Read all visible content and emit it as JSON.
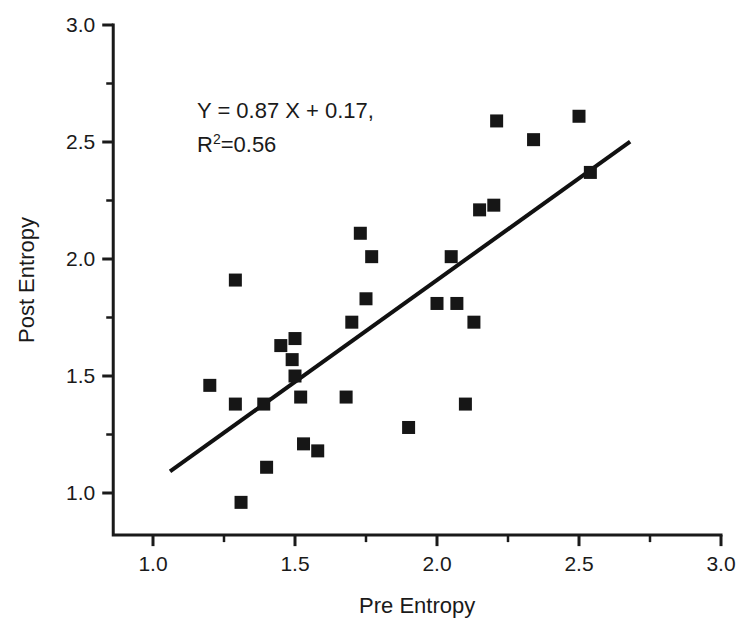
{
  "figure": {
    "background": "#ffffff",
    "foreground": "#1a1a1a",
    "marker_color": "#161616",
    "line_color": "#111111"
  },
  "annotation": {
    "equation": "Y = 0.87 X + 0.17,",
    "r_symbol": "R",
    "r_exponent": "2",
    "r_value": "=0.56"
  },
  "chart_data": {
    "type": "scatter",
    "title": "",
    "xlabel": "Pre Entropy",
    "ylabel": "Post Entropy",
    "xlim": [
      0.86,
      3.0
    ],
    "ylim": [
      0.82,
      3.0
    ],
    "xticks": [
      1.0,
      1.5,
      2.0,
      2.5,
      3.0
    ],
    "xtick_labels": [
      "1.0",
      "1.5",
      "2.0",
      "2.5",
      "3.0"
    ],
    "xminor_ticks": [
      1.25,
      1.75,
      2.25,
      2.75
    ],
    "yticks": [
      1.0,
      1.5,
      2.0,
      2.5,
      3.0
    ],
    "ytick_labels": [
      "1.0",
      "1.5",
      "2.0",
      "2.5",
      "3.0"
    ],
    "yminor_ticks": [
      1.25,
      1.75,
      2.25,
      2.75
    ],
    "grid": false,
    "legend": null,
    "marker": "square",
    "points": [
      {
        "x": 1.2,
        "y": 1.46
      },
      {
        "x": 1.29,
        "y": 1.91
      },
      {
        "x": 1.29,
        "y": 1.38
      },
      {
        "x": 1.31,
        "y": 0.96
      },
      {
        "x": 1.39,
        "y": 1.38
      },
      {
        "x": 1.4,
        "y": 1.11
      },
      {
        "x": 1.45,
        "y": 1.63
      },
      {
        "x": 1.49,
        "y": 1.57
      },
      {
        "x": 1.5,
        "y": 1.5
      },
      {
        "x": 1.5,
        "y": 1.66
      },
      {
        "x": 1.52,
        "y": 1.41
      },
      {
        "x": 1.53,
        "y": 1.21
      },
      {
        "x": 1.58,
        "y": 1.18
      },
      {
        "x": 1.68,
        "y": 1.41
      },
      {
        "x": 1.7,
        "y": 1.73
      },
      {
        "x": 1.73,
        "y": 2.11
      },
      {
        "x": 1.75,
        "y": 1.83
      },
      {
        "x": 1.77,
        "y": 2.01
      },
      {
        "x": 1.9,
        "y": 1.28
      },
      {
        "x": 2.0,
        "y": 1.81
      },
      {
        "x": 2.05,
        "y": 2.01
      },
      {
        "x": 2.07,
        "y": 1.81
      },
      {
        "x": 2.1,
        "y": 1.38
      },
      {
        "x": 2.13,
        "y": 1.73
      },
      {
        "x": 2.15,
        "y": 2.21
      },
      {
        "x": 2.2,
        "y": 2.23
      },
      {
        "x": 2.21,
        "y": 2.59
      },
      {
        "x": 2.34,
        "y": 2.51
      },
      {
        "x": 2.5,
        "y": 2.61
      },
      {
        "x": 2.54,
        "y": 2.37
      }
    ],
    "fit_line": {
      "label": "Y = 0.87 X + 0.17",
      "slope": 0.87,
      "intercept": 0.17,
      "r_squared": 0.56,
      "x_start": 1.06,
      "x_end": 2.68
    }
  }
}
